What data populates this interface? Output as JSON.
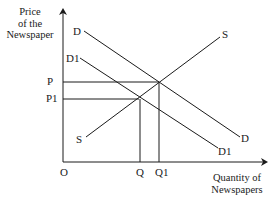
{
  "diagram": {
    "type": "supply-demand",
    "y_axis_title": [
      "Price",
      "of the",
      "Newspaper"
    ],
    "x_axis_title": [
      "Quantity of",
      "Newspapers"
    ],
    "origin_label": "O",
    "curves": {
      "demand_original": "D",
      "demand_original_end": "D",
      "demand_shifted": "D1",
      "demand_shifted_end": "D1",
      "supply_top": "S",
      "supply_bottom": "S"
    },
    "price_labels": {
      "p": "P",
      "p1": "P1"
    },
    "quantity_labels": {
      "q": "Q",
      "q1": "Q1"
    },
    "line_color": "#1a1a1a"
  }
}
